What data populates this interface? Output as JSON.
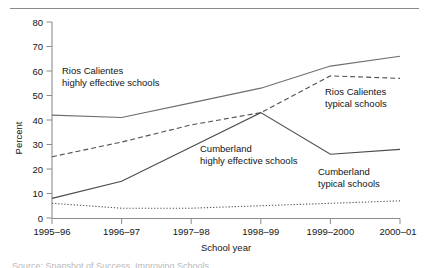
{
  "figure": {
    "background_color": "#ffffff",
    "has_top_rule": true,
    "bottom_fragment_text": "Source: Snapshot of Success, Improving Schools"
  },
  "chart_data": {
    "type": "line",
    "title": "",
    "xlabel": "School year",
    "ylabel": "Percent",
    "categories": [
      "1995–96",
      "1996–97",
      "1997–98",
      "1998–99",
      "1999–2000",
      "2000–01"
    ],
    "ylim": [
      0,
      80
    ],
    "yticks": [
      0,
      10,
      20,
      30,
      40,
      50,
      60,
      70,
      80
    ],
    "ytick_labels": [
      "0",
      "10",
      "20",
      "30",
      "40",
      "50",
      "60",
      "70",
      "80"
    ],
    "grid": false,
    "legend_position": "inline-annotations",
    "series": [
      {
        "name": "Rios Calientes highly effective schools",
        "style": "solid",
        "color": "#6e6e6e",
        "values": [
          42,
          41,
          47,
          53,
          62,
          66
        ]
      },
      {
        "name": "Rios Calientes typical schools",
        "style": "dashed",
        "color": "#4f4f4f",
        "values": [
          25,
          31,
          38,
          43,
          58,
          57
        ]
      },
      {
        "name": "Cumberland highly effective schools",
        "style": "solid",
        "color": "#4a4a4a",
        "values": [
          8,
          15,
          29,
          43,
          26,
          28
        ]
      },
      {
        "name": "Cumberland typical schools",
        "style": "dotted",
        "color": "#5a5a5a",
        "values": [
          6,
          4,
          4,
          5,
          6,
          7
        ]
      }
    ],
    "annotations": [
      {
        "id": "rios-highly-effective",
        "line1": "Rios Calientes",
        "line2": "highly effective schools",
        "x": 62,
        "y": 74
      },
      {
        "id": "rios-typical",
        "line1": "Rios Calientes",
        "line2": "typical schools",
        "x": 325,
        "y": 95
      },
      {
        "id": "cumberland-highly-effective",
        "line1": "Cumberland",
        "line2": "highly effective schools",
        "x": 200,
        "y": 152
      },
      {
        "id": "cumberland-typical",
        "line1": "Cumberland",
        "line2": "typical schools",
        "x": 318,
        "y": 175
      }
    ]
  }
}
